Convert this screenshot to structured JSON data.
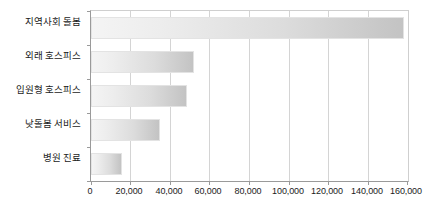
{
  "chart_data": {
    "type": "bar",
    "orientation": "horizontal",
    "title": "",
    "xlabel": "",
    "ylabel": "",
    "categories": [
      "지역사회 돌봄",
      "외래 호스피스",
      "입원형 호스피스",
      "낮돌봄 서비스",
      "병원 진료"
    ],
    "values": [
      158000,
      52000,
      48500,
      35000,
      15500
    ],
    "xlim": [
      0,
      160000
    ],
    "xticks": [
      0,
      20000,
      40000,
      60000,
      80000,
      100000,
      120000,
      140000,
      160000
    ],
    "xtick_labels": [
      "0",
      "20,000",
      "40,000",
      "60,000",
      "80,000",
      "100,000",
      "120,000",
      "140,000",
      "160,000"
    ],
    "grid": true,
    "grid_axis": "x",
    "legend": false,
    "bar_fill_start": "#f4f4f4",
    "bar_fill_end": "#c3c3c3",
    "bar_border_color": "#e3e3e3",
    "axis_color": "#9a9a9a",
    "gridline_color": "#d4d4d4",
    "background": "#ffffff"
  }
}
